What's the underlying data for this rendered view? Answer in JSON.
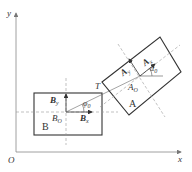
{
  "axes": {
    "x_label": "x",
    "y_label": "y",
    "origin_label": "O"
  },
  "body_b": {
    "name": "B",
    "center_label": "B",
    "center_sub": "O",
    "x_axis_label": "B",
    "x_axis_sub": "x",
    "y_axis_label": "B",
    "y_axis_sub": "y",
    "angle_label": "φ",
    "angle_sub": "0"
  },
  "body_a": {
    "name": "A",
    "center_label": "A",
    "center_sub": "O",
    "x_axis_label": "A",
    "x_axis_sub": "x",
    "y_axis_label": "A",
    "y_axis_sub": "y",
    "angle_label": "α",
    "angle_sub": "0"
  },
  "contact_point": {
    "label": "T"
  },
  "colors": {
    "outline": "#333333",
    "dashed": "#888888",
    "axis": "#777777"
  }
}
